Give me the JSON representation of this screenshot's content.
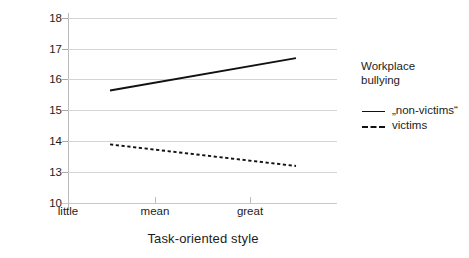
{
  "chart_data": {
    "type": "line",
    "title": "",
    "xlabel": "Task-oriented style",
    "ylabel": "Job satisfaction",
    "categories": [
      "little",
      "mean",
      "great"
    ],
    "ytick_labels": [
      "18",
      "17",
      "16",
      "15",
      "14",
      "13",
      "10"
    ],
    "ylim": [
      10,
      18
    ],
    "grid": true,
    "legend_position": "right",
    "legend_title": "Workplace bullying",
    "series": [
      {
        "name": "„non-victims“",
        "style": "solid",
        "color": "#111111",
        "values": [
          15.65,
          16.18,
          16.7
        ]
      },
      {
        "name": "victims",
        "style": "dashed",
        "color": "#111111",
        "values": [
          13.9,
          13.55,
          13.2
        ]
      }
    ]
  },
  "axes": {
    "y_title": "Job satisfaction",
    "x_title": "Task-oriented style",
    "y_ticks": [
      {
        "label": "18"
      },
      {
        "label": "17"
      },
      {
        "label": "16"
      },
      {
        "label": "15"
      },
      {
        "label": "14"
      },
      {
        "label": "13"
      },
      {
        "label": "10"
      }
    ],
    "x_ticks": [
      {
        "label": "little"
      },
      {
        "label": "mean"
      },
      {
        "label": "great"
      }
    ]
  },
  "legend": {
    "title_line1": "Workplace",
    "title_line2": "bullying",
    "entries": [
      {
        "label": "„non-victims“",
        "style": "solid"
      },
      {
        "label": "victims",
        "style": "dashed"
      }
    ]
  }
}
